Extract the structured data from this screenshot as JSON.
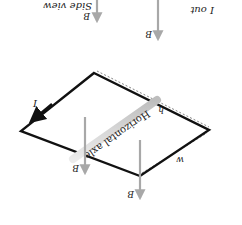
{
  "orientation": "rotated-180",
  "colors": {
    "loop": "#111111",
    "field_arrow": "#a8a8a8",
    "axle": "#d0d0d0",
    "dimension_line": "#666666",
    "text": "#222222"
  },
  "labels": {
    "current": "I",
    "current_out": "I out",
    "side_view": "Side view",
    "axle": "Horizontal axle",
    "height": "h",
    "width": "w",
    "field": "B",
    "field_vector_mark": "→"
  }
}
